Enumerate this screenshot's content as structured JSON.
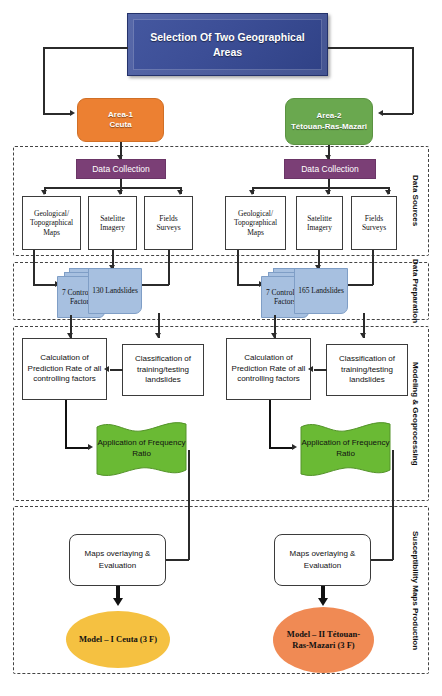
{
  "diagram": {
    "title": "Selection Of Two Geographical Areas",
    "areas": {
      "left": "Area-1\nCeuta",
      "right": "Area-2\nTétouan-Ras-Mazari"
    },
    "bands": [
      {
        "label": "Data Sources"
      },
      {
        "label": "Data Preparation"
      },
      {
        "label": "Modeling & Geoprocessing"
      },
      {
        "label": "Susceptibility Maps Production"
      }
    ],
    "left_branch": {
      "collection": "Data Collection",
      "sources": [
        "Geological/ Topographical Maps",
        "Satelitte Imagery",
        "Fields Surveys"
      ],
      "factors": "7 Controling Factors",
      "landslides": "130 Landslides",
      "prediction": "Calculation of Prediction Rate of all controlling factors",
      "classification": "Classification of training/testing landslides",
      "frequency": "Application of Frequency Ratio",
      "overlay": "Maps overlaying & Evaluation",
      "model": "Model – I Ceuta (3 F)"
    },
    "right_branch": {
      "collection": "Data Collection",
      "sources": [
        "Geological/ Topographical Maps",
        "Satelitte Imagery",
        "Fields Surveys"
      ],
      "factors": "7 Controling Factors",
      "landslides": "165 Landslides",
      "prediction": "Calculation of Prediction Rate of all controlling factors",
      "classification": "Classification of training/testing landslides",
      "frequency": "Application of Frequency Ratio",
      "overlay": "Maps overlaying & Evaluation",
      "model": "Model – II Tétouan-Ras-Mazari (3 F)"
    },
    "colors": {
      "title": "#3c4e96",
      "area_left": "#ec8032",
      "area_right": "#6aa84f",
      "collection": "#7b3f76",
      "document": "#a7c0e0",
      "frequency": "#6aba34",
      "model_left": "#f5c141",
      "model_right": "#f08a54"
    }
  }
}
